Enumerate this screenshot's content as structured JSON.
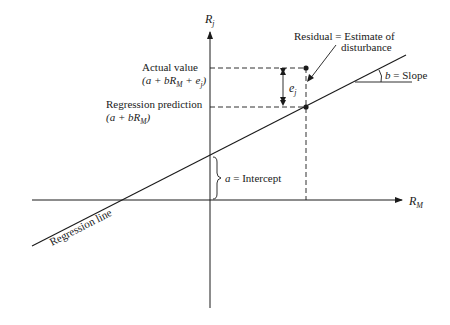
{
  "diagram": {
    "type": "regression-line-diagram",
    "colors": {
      "ink": "#1a1a1a",
      "background": "#ffffff"
    },
    "axes": {
      "y_label": "R",
      "y_label_sub": "j",
      "x_label": "R",
      "x_label_sub": "M"
    },
    "labels": {
      "residual_line1": "Residual = Estimate of",
      "residual_line2": "disturbance",
      "actual_title": "Actual value",
      "actual_formula_open": "(a + bR",
      "actual_formula_sub": "M",
      "actual_formula_mid": " + e",
      "actual_formula_sub2": "j",
      "actual_formula_close": ")",
      "prediction_title": "Regression prediction",
      "prediction_formula_open": "(a + bR",
      "prediction_formula_sub": "M",
      "prediction_formula_close": ")",
      "error_term": "e",
      "error_term_sub": "j",
      "slope_var": "b",
      "slope_text": " = Slope",
      "intercept_var": "a",
      "intercept_text": " = Intercept",
      "regression_line": "Regression line"
    }
  }
}
